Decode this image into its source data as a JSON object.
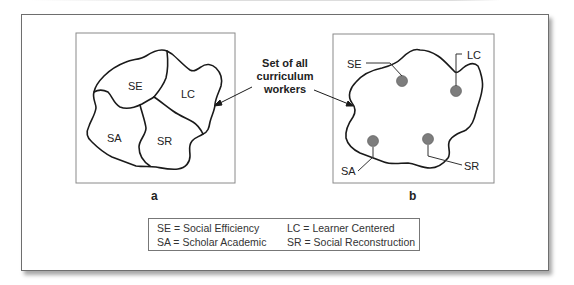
{
  "figure": {
    "panel_a": {
      "label": "a",
      "regions": [
        "SE",
        "LC",
        "SA",
        "SR"
      ]
    },
    "panel_b": {
      "label": "b",
      "points": [
        {
          "label": "SE"
        },
        {
          "label": "LC"
        },
        {
          "label": "SA"
        },
        {
          "label": "SR"
        }
      ]
    },
    "center_label": {
      "line1": "Set of all",
      "line2": "curriculum",
      "line3": "workers"
    },
    "legend": [
      {
        "text": "SE = Social Efficiency"
      },
      {
        "text": "LC = Learner Centered"
      },
      {
        "text": "SA = Scholar Academic"
      },
      {
        "text": "SR = Social Reconstruction"
      }
    ],
    "colors": {
      "line": "#1a1a1a",
      "box_border": "#7a7a7a",
      "dot_fill": "#808080"
    }
  }
}
